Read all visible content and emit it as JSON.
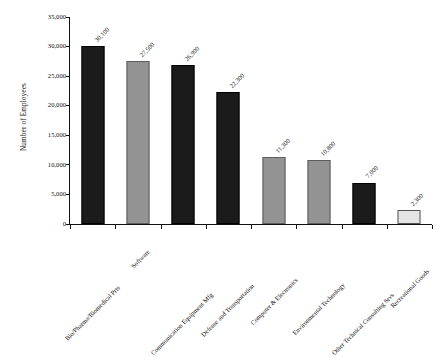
{
  "chart_data": {
    "type": "bar",
    "title": "",
    "xlabel": "",
    "ylabel": "Number of Employees",
    "ylim": [
      0,
      35000
    ],
    "grid": false,
    "legend": "none",
    "y_ticks": [
      "0",
      "5,000",
      "10,000",
      "15,000",
      "20,000",
      "25,000",
      "30,000",
      "35,000"
    ],
    "y_tick_values": [
      0,
      5000,
      10000,
      15000,
      20000,
      25000,
      30000,
      35000
    ],
    "categories": [
      "Bio/Pharma/Biomedical Prts",
      "Software",
      "Communication Equipment Mfg",
      "Defense and Transportation",
      "Computer & Electronics",
      "Environmental Technology",
      "Other Technical Consulting Srvs",
      "Recreational Goods"
    ],
    "values": [
      30100,
      27500,
      26900,
      22300,
      11300,
      10800,
      7000,
      2300
    ],
    "value_labels": [
      "30,100",
      "27,500",
      "26,900",
      "22,300",
      "11,300",
      "10,800",
      "7,000",
      "2,300"
    ],
    "bar_colors": [
      "#1b1b1b",
      "#939393",
      "#1b1b1b",
      "#1b1b1b",
      "#939393",
      "#939393",
      "#1b1b1b",
      "#e4e4e4"
    ],
    "bar_styles": [
      "dark",
      "mid",
      "dark",
      "dark",
      "mid",
      "mid",
      "dark",
      "light"
    ]
  }
}
